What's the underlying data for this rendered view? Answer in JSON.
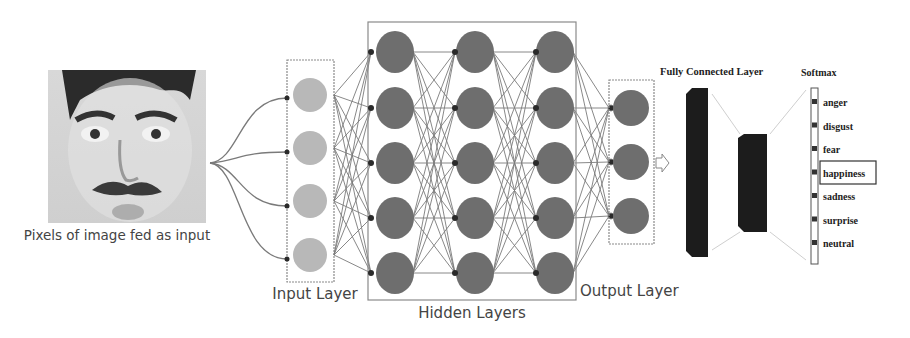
{
  "input_image": {
    "caption": "Pixels of image fed as input",
    "description": "grayscale face photo"
  },
  "layers": {
    "input": {
      "label": "Input Layer",
      "nodes": 4,
      "fill": "#b8b8b8"
    },
    "hidden": {
      "label": "Hidden Layers",
      "columns": 3,
      "nodes_per_column": 5,
      "fill": "#6e6e6e"
    },
    "output": {
      "label": "Output Layer",
      "nodes": 3,
      "fill": "#6e6e6e"
    },
    "fully_connected": {
      "label": "Fully Connected  Layer",
      "fill": "#1c1c1c"
    },
    "softmax": {
      "label": "Softmax",
      "classes": [
        "anger",
        "disgust",
        "fear",
        "happiness",
        "sadness",
        "surprise",
        "neutral"
      ],
      "highlighted": "happiness"
    }
  },
  "colors": {
    "edge": "#7a7a7a",
    "junction": "#2a2a2a",
    "box": "#8a8a8a"
  }
}
